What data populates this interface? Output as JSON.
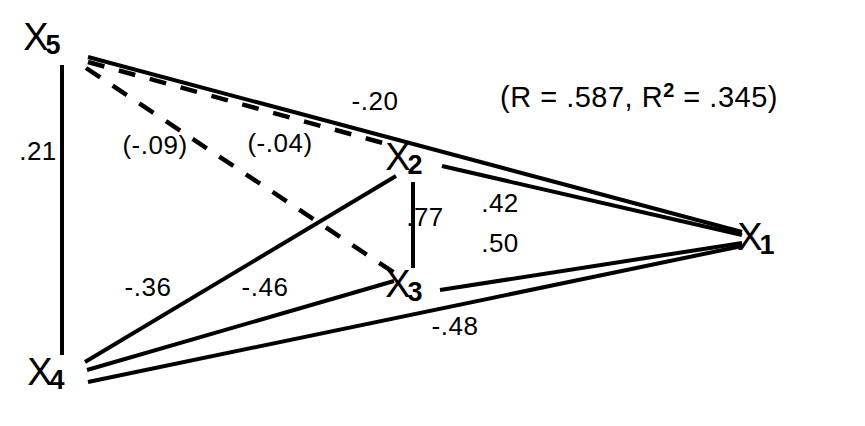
{
  "figure": {
    "type": "path-diagram",
    "background_color": "#ffffff",
    "line_color": "#000000"
  },
  "statistics": {
    "prefix": "(R = .587, R",
    "exponent": "2",
    "suffix": " = .345)",
    "R": ".587",
    "R_squared": ".345",
    "x": 500,
    "y": 107
  },
  "nodes": [
    {
      "id": "X1",
      "base": "X",
      "subscript": "1",
      "x": 765,
      "y": 240,
      "label_x": 750,
      "label_y": 240
    },
    {
      "id": "X2",
      "base": "X",
      "subscript": "2",
      "x": 415,
      "y": 160,
      "label_x": 398,
      "label_y": 160
    },
    {
      "id": "X3",
      "base": "X",
      "subscript": "3",
      "x": 415,
      "y": 287,
      "label_x": 398,
      "label_y": 287
    },
    {
      "id": "X4",
      "base": "X",
      "subscript": "4",
      "x": 65,
      "y": 375,
      "label_x": 40,
      "label_y": 375
    },
    {
      "id": "X5",
      "base": "X",
      "subscript": "5",
      "x": 60,
      "y": 40,
      "label_x": 36,
      "label_y": 40
    }
  ],
  "edges": [
    {
      "name": "edge-x5-x1",
      "from": "X5",
      "to": "X1",
      "style": "solid",
      "value": "-.20",
      "label_x": 375,
      "label_y": 110,
      "x1": 88,
      "y1": 57,
      "x2": 742,
      "y2": 232
    },
    {
      "name": "edge-x5-x2",
      "from": "X5",
      "to": "X2",
      "style": "dashed",
      "value": "(-.04)",
      "label_x": 280,
      "label_y": 152,
      "x1": 88,
      "y1": 62,
      "x2": 394,
      "y2": 146
    },
    {
      "name": "edge-x5-x3",
      "from": "X5",
      "to": "X3",
      "style": "dashed",
      "value": "(-.09)",
      "label_x": 155,
      "label_y": 154,
      "x1": 86,
      "y1": 68,
      "x2": 396,
      "y2": 274
    },
    {
      "name": "edge-x5-x4",
      "from": "X5",
      "to": "X4",
      "style": "solid",
      "value": ".21",
      "label_x": 38,
      "label_y": 160,
      "x1": 62,
      "y1": 65,
      "x2": 62,
      "y2": 355
    },
    {
      "name": "edge-x4-x2",
      "from": "X4",
      "to": "X2",
      "style": "solid",
      "value": "-.36",
      "label_x": 148,
      "label_y": 296,
      "x1": 85,
      "y1": 362,
      "x2": 396,
      "y2": 176
    },
    {
      "name": "edge-x4-x3",
      "from": "X4",
      "to": "X3",
      "style": "solid",
      "value": "-.46",
      "label_x": 265,
      "label_y": 296,
      "x1": 87,
      "y1": 370,
      "x2": 394,
      "y2": 281
    },
    {
      "name": "edge-x4-x1",
      "from": "X4",
      "to": "X1",
      "style": "solid",
      "value": "-.48",
      "label_x": 455,
      "label_y": 335,
      "x1": 88,
      "y1": 382,
      "x2": 742,
      "y2": 246
    },
    {
      "name": "edge-x2-x3",
      "from": "X2",
      "to": "X3",
      "style": "solid",
      "value": ".77",
      "label_x": 425,
      "label_y": 226,
      "x1": 413,
      "y1": 182,
      "x2": 413,
      "y2": 268
    },
    {
      "name": "edge-x2-x1",
      "from": "X2",
      "to": "X1",
      "style": "solid",
      "value": ".42",
      "label_x": 500,
      "label_y": 212,
      "x1": 442,
      "y1": 166,
      "x2": 742,
      "y2": 235
    },
    {
      "name": "edge-x3-x1",
      "from": "X3",
      "to": "X1",
      "style": "solid",
      "value": ".50",
      "label_x": 500,
      "label_y": 252,
      "x1": 440,
      "y1": 290,
      "x2": 742,
      "y2": 243
    }
  ]
}
